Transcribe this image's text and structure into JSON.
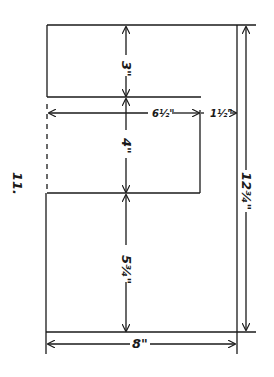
{
  "diagram": {
    "figure_label": "11.",
    "dimensions": {
      "top_height": "3\"",
      "inner_width": "6½\"",
      "offset_width": "1½\"",
      "middle_height": "4\"",
      "bottom_height": "5¾\"",
      "total_height": "12¾\"",
      "total_width": "8\""
    },
    "colors": {
      "line": "#1a1a1a",
      "background": "#ffffff"
    }
  }
}
